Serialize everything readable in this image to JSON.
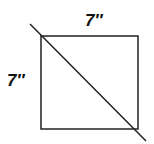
{
  "diagram": {
    "shape": "square",
    "top_label": "7″",
    "left_label": "7″",
    "stroke_color": "#222222",
    "background": "#ffffff",
    "has_diagonal": true
  }
}
